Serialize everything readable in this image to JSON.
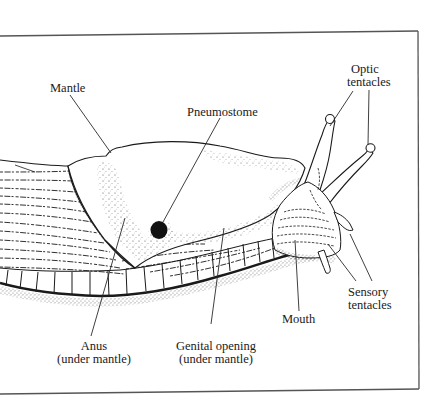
{
  "figure": {
    "frame_color": "#555555",
    "ink_color": "#1a1a1a"
  },
  "labels": {
    "mantle": "Mantle",
    "pneumostome": "Pneumostome",
    "optic_tentacles_line1": "Optic",
    "optic_tentacles_line2": "tentacles",
    "sensory_tentacles_line1": "Sensory",
    "sensory_tentacles_line2": "tentacles",
    "mouth": "Mouth",
    "anus_line1": "Anus",
    "anus_line2": "(under mantle)",
    "genital_line1": "Genital opening",
    "genital_line2": "(under mantle)"
  }
}
